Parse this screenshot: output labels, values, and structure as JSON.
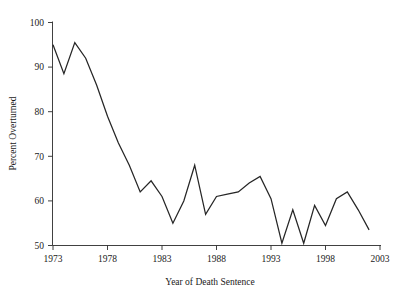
{
  "chart_data": {
    "type": "line",
    "title": "",
    "xlabel": "Year of Death Sentence",
    "ylabel": "Percent Overturned",
    "xlim": [
      1972.0,
      2003.2
    ],
    "ylim": [
      49.0,
      101.5
    ],
    "xticks": [
      1973,
      1978,
      1983,
      1988,
      1993,
      1998,
      2003
    ],
    "yticks": [
      50,
      60,
      70,
      80,
      90,
      100
    ],
    "xtick_labels": [
      "1973",
      "1978",
      "1983",
      "1988",
      "1993",
      "1998",
      "2003"
    ],
    "ytick_labels": [
      "50",
      "60",
      "70",
      "80",
      "90",
      "100"
    ],
    "grid": false,
    "legend": false,
    "legend_position": "none",
    "line_color": "#262626",
    "x": [
      1973,
      1974,
      1975,
      1976,
      1977,
      1978,
      1979,
      1980,
      1981,
      1982,
      1983,
      1984,
      1985,
      1986,
      1987,
      1988,
      1989,
      1990,
      1991,
      1992,
      1993,
      1994,
      1995,
      1996,
      1997,
      1998,
      1999,
      2000,
      2001,
      2002
    ],
    "values": [
      95.0,
      88.5,
      95.5,
      92.0,
      86.0,
      79.0,
      73.0,
      68.0,
      62.0,
      64.5,
      61.0,
      55.0,
      60.0,
      68.0,
      57.0,
      61.0,
      61.5,
      62.0,
      64.0,
      65.5,
      60.5,
      50.5,
      58.0,
      50.5,
      59.0,
      54.5,
      60.5,
      62.0,
      58.0,
      53.5
    ],
    "series": [
      {
        "name": "Percent Overturned",
        "values": [
          95.0,
          88.5,
          95.5,
          92.0,
          86.0,
          79.0,
          73.0,
          68.0,
          62.0,
          64.5,
          61.0,
          55.0,
          60.0,
          68.0,
          57.0,
          61.0,
          61.5,
          62.0,
          64.0,
          65.5,
          60.5,
          50.5,
          58.0,
          50.5,
          59.0,
          54.5,
          60.5,
          62.0,
          58.0,
          53.5
        ]
      }
    ]
  },
  "axes": {
    "y_title": "Percent Overturned",
    "x_title": "Year of Death Sentence"
  }
}
